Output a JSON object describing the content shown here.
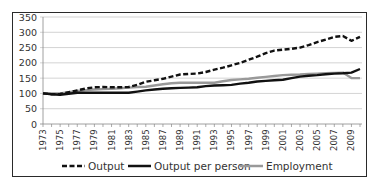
{
  "chart_data": {
    "type": "line",
    "title": "",
    "xlabel": "",
    "ylabel": "",
    "ylim": [
      0,
      350
    ],
    "yticks": [
      0,
      50,
      100,
      150,
      200,
      250,
      300,
      350
    ],
    "grid": true,
    "legend_position": "bottom",
    "x_tick_labels": [
      "1973",
      "1975",
      "1977",
      "1979",
      "1981",
      "1983",
      "1985",
      "1987",
      "1989",
      "1991",
      "1993",
      "1995",
      "1997",
      "1999",
      "2001",
      "2003",
      "2005",
      "2007",
      "2009"
    ],
    "x": [
      1973,
      1974,
      1975,
      1976,
      1977,
      1978,
      1979,
      1980,
      1981,
      1982,
      1983,
      1984,
      1985,
      1986,
      1987,
      1988,
      1989,
      1990,
      1991,
      1992,
      1993,
      1994,
      1995,
      1996,
      1997,
      1998,
      1999,
      2000,
      2001,
      2002,
      2003,
      2004,
      2005,
      2006,
      2007,
      2008,
      2009,
      2010
    ],
    "series": [
      {
        "name": "Output",
        "style": "dashed",
        "color": "#111111",
        "values": [
          100,
          97,
          98,
          104,
          110,
          116,
          120,
          121,
          120,
          120,
          121,
          128,
          138,
          143,
          148,
          155,
          162,
          164,
          165,
          170,
          178,
          184,
          192,
          200,
          210,
          220,
          232,
          240,
          243,
          246,
          250,
          258,
          268,
          276,
          285,
          288,
          272,
          285
        ]
      },
      {
        "name": "Output per person",
        "style": "solid",
        "color": "#111111",
        "values": [
          100,
          97,
          96,
          99,
          102,
          102,
          102,
          102,
          102,
          102,
          102,
          106,
          110,
          113,
          115,
          117,
          118,
          119,
          120,
          124,
          126,
          127,
          128,
          132,
          135,
          139,
          141,
          143,
          145,
          150,
          155,
          158,
          160,
          163,
          165,
          166,
          168,
          180
        ]
      },
      {
        "name": "Employment",
        "style": "solid",
        "color": "#999999",
        "values": [
          100,
          100,
          100,
          104,
          108,
          111,
          113,
          114,
          115,
          117,
          119,
          121,
          122,
          126,
          130,
          133,
          135,
          135,
          135,
          135,
          135,
          140,
          144,
          146,
          148,
          151,
          154,
          157,
          160,
          161,
          162,
          164,
          165,
          166,
          167,
          168,
          150,
          150
        ]
      }
    ]
  },
  "axis": {
    "y_labels": [
      "0",
      "50",
      "100",
      "150",
      "200",
      "250",
      "300",
      "350"
    ]
  },
  "legend": {
    "items": [
      {
        "label": "Output"
      },
      {
        "label": "Output per person"
      },
      {
        "label": "Employment"
      }
    ]
  }
}
